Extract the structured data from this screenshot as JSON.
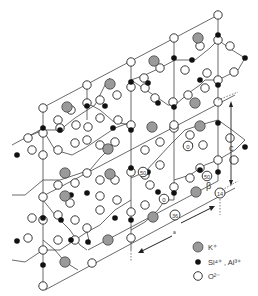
{
  "figure": {
    "title": "",
    "axis_labels": {
      "c": "c",
      "a": "a"
    },
    "angle_label": "β",
    "atom_labels": [
      "0",
      "50",
      "50",
      "0",
      "36",
      "14"
    ]
  },
  "legend": {
    "items": [
      {
        "symbol": "grey-circle",
        "label": "K⁺"
      },
      {
        "symbol": "black-dot",
        "label": "Si⁴⁺ , Al³⁺"
      },
      {
        "symbol": "white-circle",
        "label": "O²⁻"
      }
    ]
  },
  "colors": {
    "potassium": "#9a9a9a",
    "silicon_aluminium": "#111111",
    "oxygen": "#ffffff",
    "bonds": "#333333"
  }
}
